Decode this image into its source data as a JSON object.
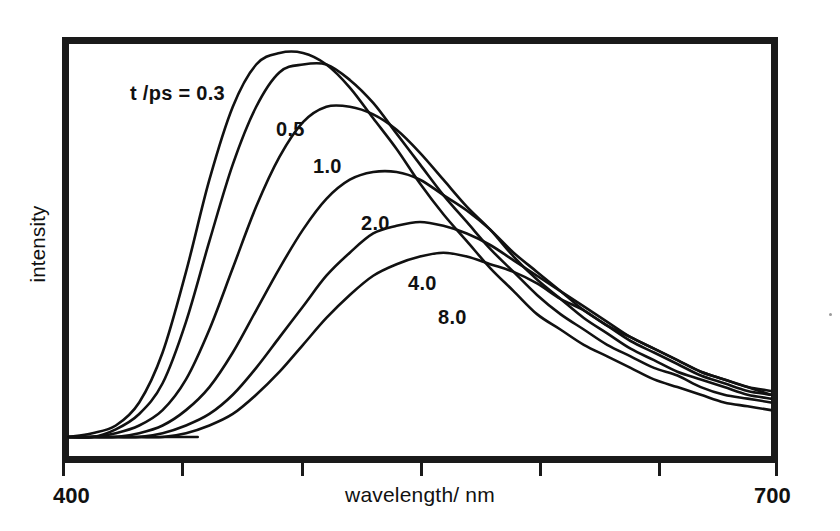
{
  "figure": {
    "kind": "time-resolved-fluorescence-spectra",
    "background_color": "#ffffff",
    "ink_color": "#111111",
    "frame_color": "#1a1a1a"
  },
  "axes": {
    "x": {
      "label": "wavelength/ nm",
      "min_label": "400",
      "max_label": "700",
      "min": 400,
      "max": 700,
      "tick_step": 50,
      "tick_labels": [
        "400",
        "",
        "",
        "",
        "",
        "",
        "700"
      ]
    },
    "y": {
      "label": "intensity",
      "tick_labels": []
    }
  },
  "legend": {
    "header": "t /ps = 0.3",
    "entries": [
      "0.3",
      "0.5",
      "1.0",
      "2.0",
      "4.0",
      "8.0"
    ],
    "inline_labels": [
      "0.5",
      "1.0",
      "2.0",
      "4.0",
      "8.0"
    ]
  },
  "chart_data": {
    "type": "line",
    "title": "",
    "subtitle": "",
    "xlabel": "wavelength/ nm",
    "ylabel": "intensity",
    "xlim": [
      400,
      700
    ],
    "ylim": [
      0,
      1.0
    ],
    "grid": false,
    "legend_position": "inline-annotations",
    "annotations": [
      {
        "text": "t /ps = 0.3",
        "x": 455,
        "y": 0.86
      },
      {
        "text": "0.5",
        "x": 516,
        "y": 0.74
      },
      {
        "text": "1.0",
        "x": 532,
        "y": 0.65
      },
      {
        "text": "2.0",
        "x": 552,
        "y": 0.5
      },
      {
        "text": "4.0",
        "x": 571,
        "y": 0.36
      },
      {
        "text": "8.0",
        "x": 583,
        "y": 0.28
      }
    ],
    "x": [
      400,
      410,
      420,
      430,
      440,
      450,
      460,
      470,
      480,
      490,
      500,
      510,
      520,
      530,
      540,
      550,
      560,
      570,
      580,
      590,
      600,
      610,
      620,
      630,
      640,
      650,
      660,
      670,
      680,
      690,
      700
    ],
    "series": [
      {
        "name": "0.3",
        "label": "t /ps = 0.3",
        "peak_wavelength": 500,
        "peak_intensity": 1.0,
        "values": [
          0.0,
          0.01,
          0.03,
          0.09,
          0.22,
          0.43,
          0.67,
          0.86,
          0.97,
          1.0,
          1.0,
          0.97,
          0.91,
          0.83,
          0.75,
          0.66,
          0.58,
          0.51,
          0.44,
          0.38,
          0.32,
          0.28,
          0.24,
          0.21,
          0.18,
          0.15,
          0.13,
          0.11,
          0.09,
          0.08,
          0.07
        ]
      },
      {
        "name": "0.5",
        "label": "0.5",
        "peak_wavelength": 510,
        "peak_intensity": 0.97,
        "values": [
          0.0,
          0.0,
          0.02,
          0.06,
          0.14,
          0.3,
          0.51,
          0.71,
          0.86,
          0.95,
          0.97,
          0.97,
          0.93,
          0.87,
          0.79,
          0.71,
          0.63,
          0.56,
          0.49,
          0.43,
          0.37,
          0.32,
          0.28,
          0.24,
          0.21,
          0.18,
          0.16,
          0.13,
          0.11,
          0.1,
          0.09
        ]
      },
      {
        "name": "1.0",
        "label": "1.0",
        "peak_wavelength": 524,
        "peak_intensity": 0.86,
        "values": [
          0.0,
          0.0,
          0.01,
          0.03,
          0.07,
          0.15,
          0.28,
          0.44,
          0.6,
          0.73,
          0.82,
          0.86,
          0.86,
          0.84,
          0.8,
          0.74,
          0.67,
          0.6,
          0.54,
          0.47,
          0.41,
          0.36,
          0.31,
          0.27,
          0.23,
          0.2,
          0.17,
          0.15,
          0.13,
          0.11,
          0.1
        ]
      },
      {
        "name": "2.0",
        "label": "2.0",
        "peak_wavelength": 543,
        "peak_intensity": 0.69,
        "values": [
          0.0,
          0.0,
          0.0,
          0.01,
          0.03,
          0.07,
          0.13,
          0.22,
          0.33,
          0.44,
          0.54,
          0.62,
          0.67,
          0.69,
          0.69,
          0.67,
          0.63,
          0.59,
          0.54,
          0.48,
          0.43,
          0.38,
          0.33,
          0.29,
          0.25,
          0.22,
          0.19,
          0.16,
          0.14,
          0.12,
          0.11
        ]
      },
      {
        "name": "4.0",
        "label": "4.0",
        "peak_wavelength": 560,
        "peak_intensity": 0.56,
        "values": [
          0.0,
          0.0,
          0.0,
          0.0,
          0.01,
          0.03,
          0.06,
          0.11,
          0.18,
          0.26,
          0.34,
          0.42,
          0.48,
          0.53,
          0.55,
          0.56,
          0.55,
          0.53,
          0.5,
          0.46,
          0.42,
          0.38,
          0.34,
          0.3,
          0.26,
          0.23,
          0.2,
          0.17,
          0.15,
          0.13,
          0.11
        ]
      },
      {
        "name": "8.0",
        "label": "8.0",
        "peak_wavelength": 568,
        "peak_intensity": 0.48,
        "values": [
          0.0,
          0.0,
          0.0,
          0.0,
          0.0,
          0.01,
          0.03,
          0.06,
          0.11,
          0.17,
          0.24,
          0.31,
          0.37,
          0.42,
          0.45,
          0.47,
          0.48,
          0.47,
          0.45,
          0.43,
          0.4,
          0.36,
          0.33,
          0.29,
          0.26,
          0.23,
          0.2,
          0.17,
          0.15,
          0.13,
          0.12
        ]
      }
    ]
  }
}
